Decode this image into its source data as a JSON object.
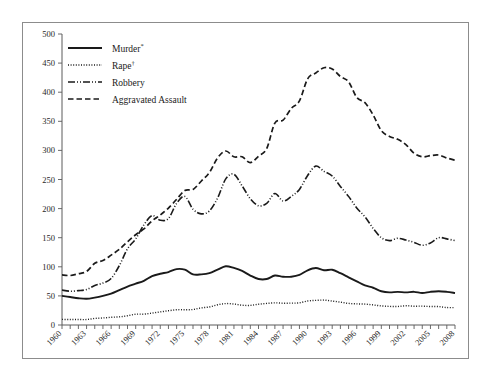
{
  "figure": {
    "background": "#ffffff",
    "frame_color": "#8c8c8c",
    "axis_color": "#5a5a5a",
    "line_color": "#1a1a1a"
  },
  "chart_data": {
    "type": "line",
    "title": "",
    "subtitle": "",
    "xlabel": "",
    "ylabel": "",
    "xlim": [
      1960,
      2008
    ],
    "ylim": [
      0,
      500
    ],
    "ytick_step": 50,
    "xtick_step": 1,
    "xtick_label_step": 3,
    "grid": false,
    "legend_position": "upper-left-inside",
    "yticks": [
      0,
      50,
      100,
      150,
      200,
      250,
      300,
      350,
      400,
      450,
      500
    ],
    "ytick_labels": [
      "0",
      "50",
      "100",
      "150",
      "200",
      "250",
      "300",
      "350",
      "400",
      "450",
      "500"
    ],
    "x": [
      1960,
      1961,
      1962,
      1963,
      1964,
      1965,
      1966,
      1967,
      1968,
      1969,
      1970,
      1971,
      1972,
      1973,
      1974,
      1975,
      1976,
      1977,
      1978,
      1979,
      1980,
      1981,
      1982,
      1983,
      1984,
      1985,
      1986,
      1987,
      1988,
      1989,
      1990,
      1991,
      1992,
      1993,
      1994,
      1995,
      1996,
      1997,
      1998,
      1999,
      2000,
      2001,
      2002,
      2003,
      2004,
      2005,
      2006,
      2007,
      2008
    ],
    "xtick_labels": [
      "1960",
      "1963",
      "1966",
      "1969",
      "1972",
      "1975",
      "1978",
      "1981",
      "1984",
      "1987",
      "1990",
      "1993",
      "1996",
      "1999",
      "2002",
      "2005",
      "2008"
    ],
    "xticks_labeled": [
      1960,
      1963,
      1966,
      1969,
      1972,
      1975,
      1978,
      1981,
      1984,
      1987,
      1990,
      1993,
      1996,
      1999,
      2002,
      2005,
      2008
    ],
    "series": [
      {
        "name": "Murder",
        "label": "Murder",
        "superscript": "*",
        "style": "solid",
        "values": [
          50,
          48,
          46,
          45,
          47,
          50,
          54,
          60,
          66,
          71,
          76,
          84,
          88,
          91,
          96,
          95,
          87,
          87,
          89,
          95,
          101,
          98,
          93,
          85,
          79,
          79,
          85,
          83,
          83,
          86,
          94,
          98,
          94,
          95,
          89,
          82,
          75,
          68,
          64,
          58,
          56,
          57,
          56,
          57,
          55,
          57,
          58,
          57,
          55
        ]
      },
      {
        "name": "Rape",
        "label": "Rape",
        "superscript": "†",
        "style": "dotted",
        "values": [
          9.6,
          9.4,
          9.4,
          9.4,
          11.2,
          12.1,
          13.2,
          14.0,
          15.9,
          18.5,
          18.7,
          20.5,
          22.5,
          24.5,
          26.2,
          26.3,
          26.6,
          29.4,
          31.0,
          34.7,
          36.8,
          36.0,
          34.0,
          33.7,
          35.7,
          37.1,
          38.1,
          37.4,
          37.6,
          38.1,
          41.2,
          42.3,
          42.8,
          41.1,
          39.3,
          37.1,
          36.3,
          35.9,
          34.5,
          32.8,
          32.0,
          31.8,
          33.1,
          32.3,
          32.4,
          31.8,
          31.6,
          30.0,
          29.8
        ]
      },
      {
        "name": "Robbery",
        "label": "Robbery",
        "superscript": "",
        "style": "dash-dot",
        "values": [
          60,
          58,
          59,
          61,
          68,
          72,
          80,
          102,
          131,
          148,
          172,
          188,
          180,
          183,
          209,
          221,
          199,
          191,
          196,
          218,
          251,
          259,
          239,
          217,
          205,
          209,
          226,
          213,
          221,
          233,
          257,
          273,
          264,
          256,
          238,
          221,
          201,
          186,
          166,
          150,
          145,
          149,
          146,
          142,
          137,
          141,
          150,
          148,
          145
        ]
      },
      {
        "name": "Aggravated Assault",
        "label": "Aggravated Assault",
        "superscript": "",
        "style": "dashed",
        "values": [
          86,
          85,
          88,
          92,
          106,
          111,
          120,
          130,
          143,
          155,
          165,
          179,
          189,
          201,
          216,
          231,
          233,
          247,
          262,
          287,
          299,
          289,
          289,
          279,
          290,
          303,
          347,
          352,
          372,
          385,
          423,
          433,
          442,
          440,
          427,
          418,
          391,
          382,
          361,
          334,
          324,
          319,
          310,
          295,
          289,
          291,
          292,
          287,
          283
        ]
      }
    ],
    "legend": [
      {
        "label": "Murder",
        "superscript": "*",
        "style": "solid"
      },
      {
        "label": "Rape",
        "superscript": "†",
        "style": "dotted"
      },
      {
        "label": "Robbery",
        "superscript": "",
        "style": "dash-dot"
      },
      {
        "label": "Aggravated Assault",
        "superscript": "",
        "style": "dashed"
      }
    ]
  }
}
